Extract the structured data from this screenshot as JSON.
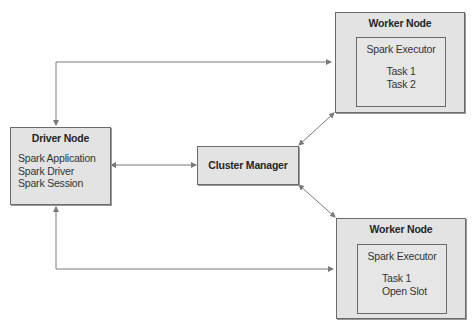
{
  "diagram": {
    "nodes": {
      "driver": {
        "title": "Driver Node",
        "items": [
          "Spark Application",
          "Spark Driver",
          "Spark Session"
        ]
      },
      "cluster_manager": {
        "title": "Cluster Manager"
      },
      "worker_top": {
        "title": "Worker Node",
        "executor": {
          "title": "Spark Executor",
          "tasks": [
            "Task 1",
            "Task 2"
          ]
        }
      },
      "worker_bottom": {
        "title": "Worker Node",
        "executor": {
          "title": "Spark Executor",
          "tasks": [
            "Task 1",
            "Open Slot"
          ]
        }
      }
    },
    "edges": [
      {
        "from": "driver",
        "to": "worker_top",
        "direction": "bidirectional"
      },
      {
        "from": "driver",
        "to": "cluster_manager",
        "direction": "bidirectional"
      },
      {
        "from": "driver",
        "to": "worker_bottom",
        "direction": "bidirectional"
      },
      {
        "from": "cluster_manager",
        "to": "worker_top",
        "direction": "bidirectional"
      },
      {
        "from": "cluster_manager",
        "to": "worker_bottom",
        "direction": "bidirectional"
      }
    ],
    "colors": {
      "box_fill": "#e3e3e3",
      "border": "#6a6a6a",
      "connector": "#7a7a7a",
      "background": "#ffffff"
    }
  }
}
